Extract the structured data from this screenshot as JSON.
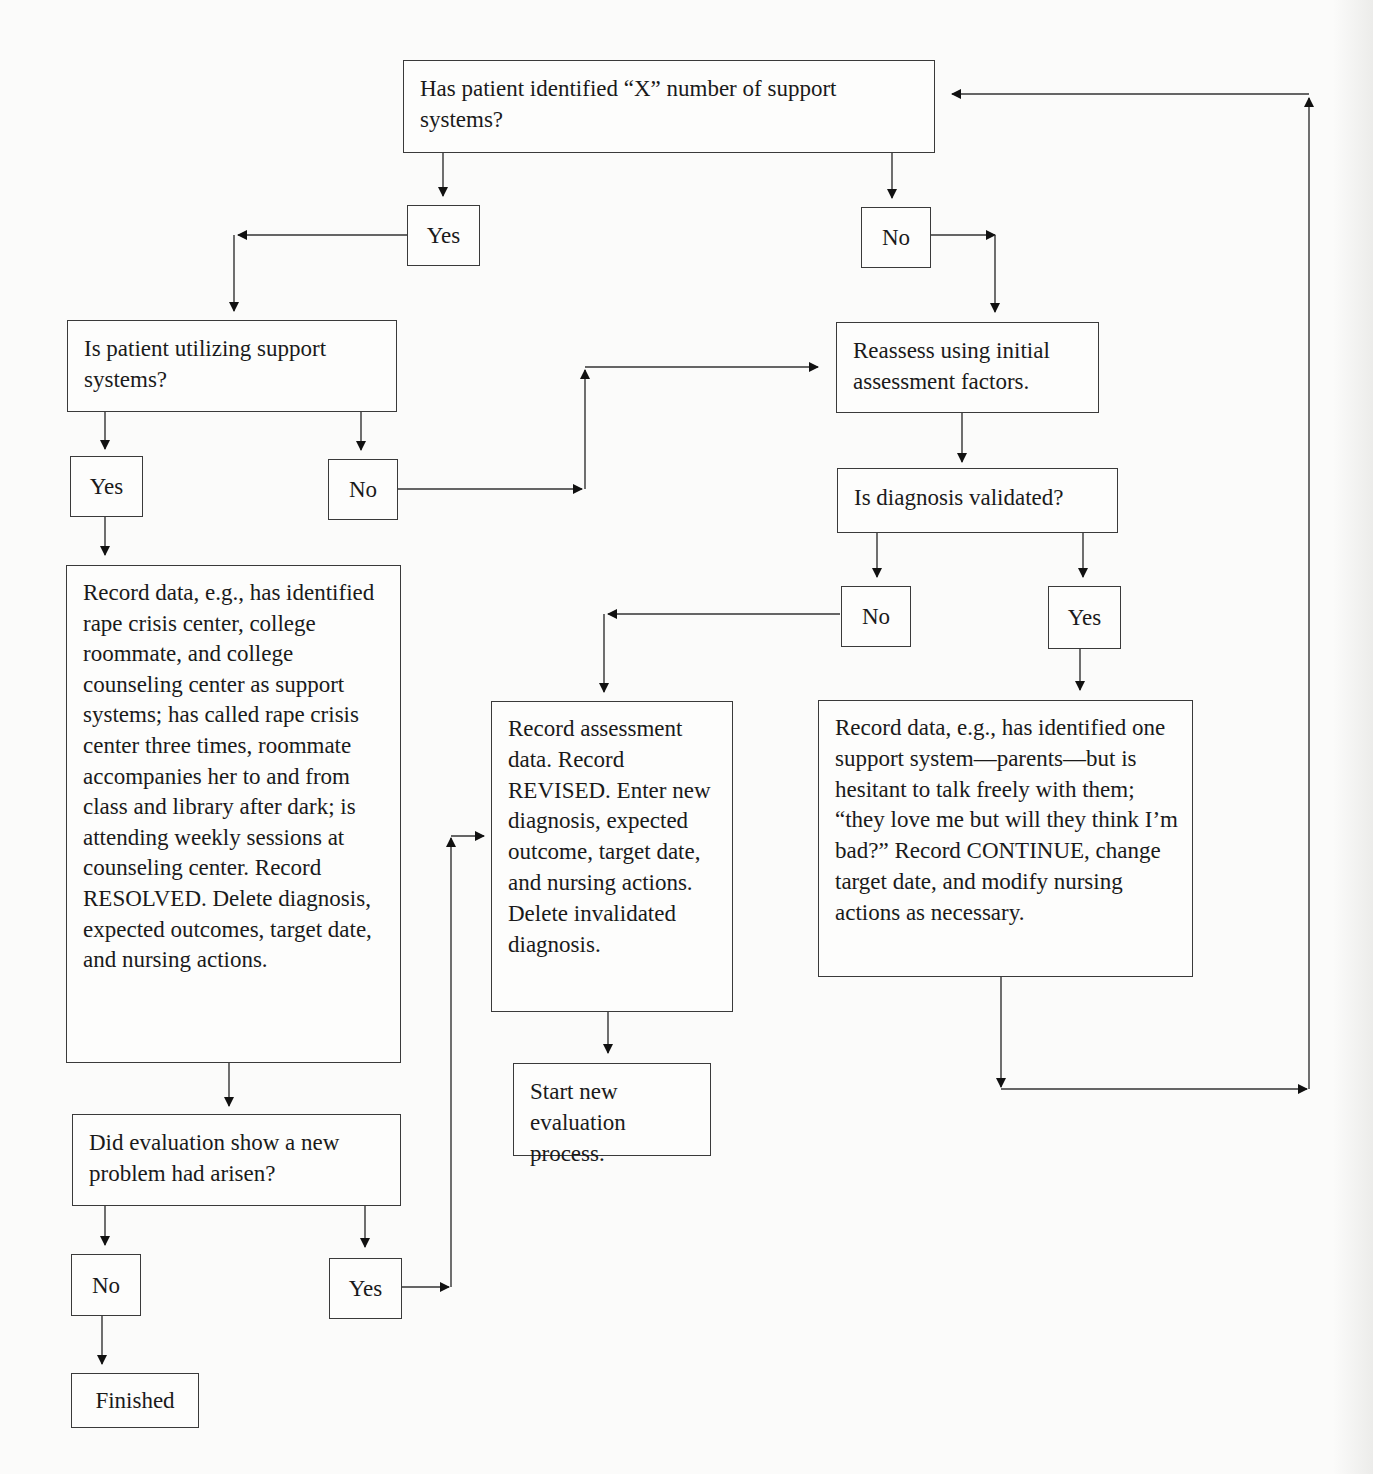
{
  "flowchart": {
    "nodes": {
      "q_support_identified": "Has patient identified “X” number of support systems?",
      "q1_yes": "Yes",
      "q1_no": "No",
      "q_utilizing": "Is patient utilizing support systems?",
      "q2_yes": "Yes",
      "q2_no": "No",
      "record_resolved": "Record data, e.g., has identified rape crisis center, college roommate, and college counseling center as support systems; has called rape crisis center three times, roommate accompanies her to and from class and library after dark; is attending weekly sessions at counseling center. Record RESOLVED. Delete diagnosis, expected outcomes, target date, and nursing actions.",
      "q_new_problem": "Did evaluation show a new problem had arisen?",
      "q3_no": "No",
      "q3_yes": "Yes",
      "finished": "Finished",
      "reassess": "Reassess using initial assessment factors.",
      "q_diagnosis_validated": "Is diagnosis validated?",
      "q4_no": "No",
      "q4_yes": "Yes",
      "record_revised": "Record assessment data. Record REVISED. Enter new diagnosis, expected outcome, target date, and nursing actions. Delete invalidated diagnosis.",
      "start_new_evaluation": "Start new evaluation process.",
      "record_continue": "Record data, e.g., has identified one support system—parents—but is hesitant to talk freely with them; “they love me but will they think I’m bad?” Record CONTINUE, change target date, and modify nursing actions as necessary."
    },
    "edges": [
      {
        "from": "q_support_identified",
        "to": "q1_yes"
      },
      {
        "from": "q_support_identified",
        "to": "q1_no"
      },
      {
        "from": "q1_yes",
        "to": "q_utilizing"
      },
      {
        "from": "q1_no",
        "to": "reassess"
      },
      {
        "from": "q_utilizing",
        "to": "q2_yes"
      },
      {
        "from": "q_utilizing",
        "to": "q2_no"
      },
      {
        "from": "q2_no",
        "to": "reassess"
      },
      {
        "from": "q2_yes",
        "to": "record_resolved"
      },
      {
        "from": "record_resolved",
        "to": "q_new_problem"
      },
      {
        "from": "q_new_problem",
        "to": "q3_no"
      },
      {
        "from": "q_new_problem",
        "to": "q3_yes"
      },
      {
        "from": "q3_no",
        "to": "finished"
      },
      {
        "from": "q3_yes",
        "to": "record_revised"
      },
      {
        "from": "reassess",
        "to": "q_diagnosis_validated"
      },
      {
        "from": "q_diagnosis_validated",
        "to": "q4_no"
      },
      {
        "from": "q_diagnosis_validated",
        "to": "q4_yes"
      },
      {
        "from": "q4_no",
        "to": "record_revised"
      },
      {
        "from": "q4_yes",
        "to": "record_continue"
      },
      {
        "from": "record_revised",
        "to": "start_new_evaluation"
      },
      {
        "from": "record_continue",
        "to": "q_support_identified"
      }
    ]
  }
}
